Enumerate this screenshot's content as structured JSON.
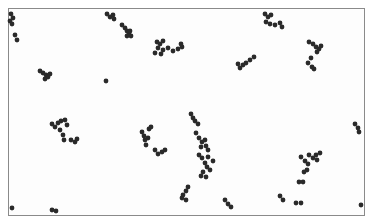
{
  "image": {
    "subject": "Micrograph of spherical bacterial cells (cocci) in scattered clusters on a light background",
    "background_color": "#ffffff",
    "frame_color": "#8a8a8a",
    "cell_color": "#2a2a2a",
    "frame": {
      "x": 8,
      "y": 8,
      "w": 356,
      "h": 207
    }
  },
  "cells": [
    [
      11,
      14
    ],
    [
      13,
      18
    ],
    [
      10,
      21
    ],
    [
      12,
      24
    ],
    [
      15,
      35
    ],
    [
      17,
      40
    ],
    [
      107,
      14
    ],
    [
      110,
      17
    ],
    [
      113,
      15
    ],
    [
      114,
      19
    ],
    [
      122,
      25
    ],
    [
      125,
      28
    ],
    [
      127,
      31
    ],
    [
      129,
      33
    ],
    [
      131,
      36
    ],
    [
      127,
      36
    ],
    [
      130,
      31
    ],
    [
      157,
      42
    ],
    [
      160,
      44
    ],
    [
      163,
      41
    ],
    [
      158,
      48
    ],
    [
      163,
      50
    ],
    [
      168,
      48
    ],
    [
      173,
      51
    ],
    [
      178,
      49
    ],
    [
      182,
      47
    ],
    [
      181,
      44
    ],
    [
      155,
      53
    ],
    [
      161,
      54
    ],
    [
      40,
      71
    ],
    [
      43,
      73
    ],
    [
      46,
      75
    ],
    [
      48,
      77
    ],
    [
      45,
      79
    ],
    [
      50,
      74
    ],
    [
      106,
      81
    ],
    [
      265,
      14
    ],
    [
      268,
      17
    ],
    [
      271,
      15
    ],
    [
      266,
      22
    ],
    [
      270,
      24
    ],
    [
      275,
      25
    ],
    [
      280,
      23
    ],
    [
      282,
      27
    ],
    [
      240,
      68
    ],
    [
      243,
      65
    ],
    [
      246,
      63
    ],
    [
      250,
      60
    ],
    [
      254,
      57
    ],
    [
      238,
      64
    ],
    [
      309,
      42
    ],
    [
      313,
      44
    ],
    [
      316,
      47
    ],
    [
      319,
      49
    ],
    [
      321,
      46
    ],
    [
      317,
      52
    ],
    [
      311,
      58
    ],
    [
      308,
      63
    ],
    [
      312,
      67
    ],
    [
      314,
      69
    ],
    [
      52,
      124
    ],
    [
      55,
      127
    ],
    [
      58,
      123
    ],
    [
      61,
      121
    ],
    [
      65,
      120
    ],
    [
      67,
      125
    ],
    [
      60,
      130
    ],
    [
      63,
      135
    ],
    [
      64,
      140
    ],
    [
      71,
      140
    ],
    [
      75,
      142
    ],
    [
      77,
      139
    ],
    [
      142,
      132
    ],
    [
      144,
      136
    ],
    [
      145,
      140
    ],
    [
      146,
      145
    ],
    [
      148,
      138
    ],
    [
      149,
      129
    ],
    [
      151,
      127
    ],
    [
      155,
      150
    ],
    [
      158,
      154
    ],
    [
      162,
      152
    ],
    [
      165,
      150
    ],
    [
      191,
      114
    ],
    [
      193,
      118
    ],
    [
      195,
      121
    ],
    [
      198,
      124
    ],
    [
      196,
      133
    ],
    [
      199,
      138
    ],
    [
      202,
      142
    ],
    [
      205,
      140
    ],
    [
      201,
      147
    ],
    [
      206,
      146
    ],
    [
      208,
      150
    ],
    [
      199,
      155
    ],
    [
      202,
      158
    ],
    [
      205,
      163
    ],
    [
      207,
      167
    ],
    [
      210,
      170
    ],
    [
      203,
      172
    ],
    [
      201,
      176
    ],
    [
      206,
      177
    ],
    [
      213,
      161
    ],
    [
      208,
      157
    ],
    [
      188,
      187
    ],
    [
      186,
      191
    ],
    [
      183,
      195
    ],
    [
      186,
      200
    ],
    [
      182,
      198
    ],
    [
      355,
      124
    ],
    [
      358,
      128
    ],
    [
      359,
      132
    ],
    [
      301,
      157
    ],
    [
      305,
      161
    ],
    [
      308,
      164
    ],
    [
      307,
      170
    ],
    [
      304,
      172
    ],
    [
      313,
      158
    ],
    [
      316,
      155
    ],
    [
      320,
      153
    ],
    [
      317,
      160
    ],
    [
      309,
      155
    ],
    [
      299,
      182
    ],
    [
      303,
      182
    ],
    [
      280,
      196
    ],
    [
      283,
      200
    ],
    [
      296,
      203
    ],
    [
      301,
      203
    ],
    [
      225,
      200
    ],
    [
      228,
      204
    ],
    [
      231,
      207
    ],
    [
      12,
      208
    ],
    [
      52,
      210
    ],
    [
      56,
      211
    ],
    [
      361,
      205
    ]
  ]
}
